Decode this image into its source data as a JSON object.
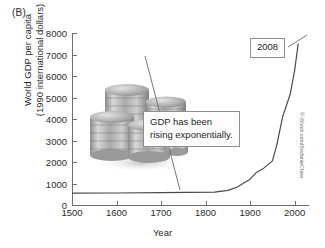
{
  "panel": {
    "label": "(B)"
  },
  "credit": {
    "text": "© iStock.com/SodanieChea"
  },
  "annotations": {
    "gdp_note": "GDP has been\nrising exponentially.",
    "year_marker": "2008"
  },
  "chart_data": {
    "type": "line",
    "title": "",
    "xlabel": "Year",
    "ylabel": "World GDP per capita\n(1990 international dollars)",
    "xlim": [
      1500,
      2030
    ],
    "ylim": [
      0,
      8000
    ],
    "grid": false,
    "legend": "none",
    "xticks": [
      1500,
      1600,
      1700,
      1800,
      1900,
      2000
    ],
    "yticks": [
      0,
      1000,
      2000,
      3000,
      4000,
      5000,
      6000,
      7000,
      8000
    ],
    "xticklabels": [
      "1500",
      "1600",
      "1700",
      "1800",
      "1900",
      "2000"
    ],
    "yticklabels": [
      "0",
      "1000",
      "2000",
      "3000",
      "4000",
      "5000",
      "6000",
      "7000",
      "8000"
    ],
    "series": [
      {
        "name": "World GDP per capita",
        "x": [
          1500,
          1600,
          1700,
          1820,
          1850,
          1870,
          1900,
          1913,
          1930,
          1950,
          1960,
          1973,
          1990,
          2000,
          2008
        ],
        "values": [
          550,
          560,
          570,
          600,
          680,
          830,
          1200,
          1500,
          1700,
          2050,
          2800,
          4100,
          5150,
          6250,
          7500
        ]
      }
    ],
    "annotation_points": [
      {
        "label": "2008",
        "x": 2008,
        "y": 7500
      },
      {
        "label": "GDP has been rising exponentially.",
        "x": 1850,
        "y": 680
      }
    ]
  }
}
